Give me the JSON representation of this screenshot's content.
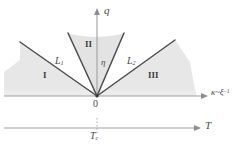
{
  "figure": {
    "type": "phase-diagram",
    "background": "#ffffff",
    "shade_color": "#e7e7e7",
    "shade_color_dark": "#dedede",
    "axis_color": "#9a9a9a",
    "line_color": "#4d4d4d",
    "label_color": "#4a4a4a"
  },
  "axes": {
    "vertical": {
      "name": "q-axis",
      "label": "q",
      "arrow": "up"
    },
    "horizontal_upper": {
      "name": "kappa-axis",
      "label_main": "κ",
      "label_relation": "~",
      "label_var": "ξ",
      "label_exponent": "−1",
      "arrow": "right"
    },
    "horizontal_lower": {
      "name": "temperature-axis",
      "label": "T",
      "arrow": "right",
      "tick_label": "T",
      "tick_sub": "c"
    },
    "origin_label": "0"
  },
  "regions": [
    {
      "id": "region-I",
      "label": "I"
    },
    {
      "id": "region-II",
      "label": "II"
    },
    {
      "id": "region-III",
      "label": "III"
    }
  ],
  "boundary_lines": [
    {
      "id": "line-L1",
      "label": "L",
      "sub": "1"
    },
    {
      "id": "line-L2",
      "label": "L",
      "sub": "2"
    }
  ],
  "angle_marker": {
    "id": "eta-angle",
    "label": "η"
  }
}
